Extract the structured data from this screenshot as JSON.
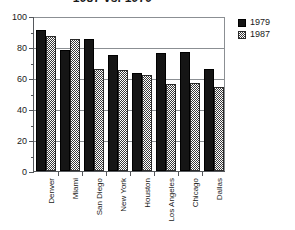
{
  "chart_data": {
    "type": "bar",
    "title": "1987 vs. 1979",
    "xlabel": "",
    "ylabel": "",
    "ylim": [
      0,
      100
    ],
    "ytick_values": [
      0,
      20,
      40,
      60,
      80,
      100
    ],
    "ytick_labels": [
      "0",
      "20",
      "40",
      "60",
      "80",
      "100"
    ],
    "yminor_values": [
      10,
      30,
      50,
      70,
      90
    ],
    "grid": true,
    "grid_axis": "y",
    "legend_position": "right",
    "categories": [
      "Denver",
      "Miami",
      "San Diego",
      "New York",
      "Houston",
      "Los Angeles",
      "Chicago",
      "Dallas"
    ],
    "series": [
      {
        "name": "1979",
        "color": "#151515",
        "pattern": "solid",
        "values": [
          91,
          78,
          85,
          75,
          63,
          76,
          77,
          66
        ]
      },
      {
        "name": "1987",
        "color": "#3a3a3a",
        "pattern": "checker",
        "values": [
          87,
          85,
          66,
          65,
          62,
          56,
          57,
          54
        ]
      }
    ]
  },
  "legend": {
    "entries": [
      {
        "label": "1979"
      },
      {
        "label": "1987"
      }
    ]
  }
}
